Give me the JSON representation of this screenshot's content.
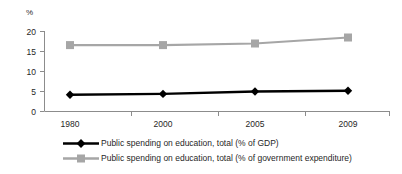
{
  "chart_data": {
    "type": "line",
    "title": "",
    "subtitle": "",
    "xlabel": "",
    "ylabel": "%",
    "categories": [
      "1980",
      "2000",
      "2005",
      "2009"
    ],
    "ylim": [
      0,
      20
    ],
    "yticks": [
      0,
      5,
      10,
      15,
      20
    ],
    "grid": false,
    "legend_position": "bottom",
    "series": [
      {
        "name": "Public spending on education, total (% of GDP)",
        "values": [
          4.2,
          4.4,
          5.0,
          5.2
        ],
        "color": "#000000",
        "marker": "diamond"
      },
      {
        "name": "Public spending on education, total (% of government expenditure)",
        "values": [
          16.6,
          16.6,
          17.0,
          18.5
        ],
        "color": "#a6a6a6",
        "marker": "square"
      }
    ]
  },
  "axis": {
    "y_title": "%",
    "y_tick_labels": [
      "20",
      "15",
      "10",
      "5",
      "0"
    ],
    "x_tick_labels": [
      "1980",
      "2000",
      "2005",
      "2009"
    ],
    "axis_color": "#8c8c8c"
  },
  "legend": {
    "items": [
      {
        "label": "Public spending on education, total (% of GDP)",
        "color": "#000000",
        "marker": "diamond-marker"
      },
      {
        "label": "Public spending on education, total (% of government expenditure)",
        "color": "#a6a6a6",
        "marker": "square-marker"
      }
    ]
  }
}
